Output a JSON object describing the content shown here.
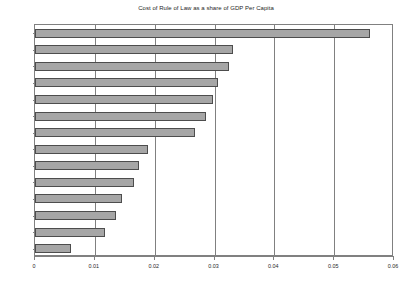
{
  "chart_data": {
    "type": "bar",
    "orientation": "horizontal",
    "title": "Cost of Rule of Law as a share of GDP Per Capita",
    "xlabel": "",
    "ylabel": "",
    "categories": [
      "JAM",
      "BOL",
      "NIC",
      "TTO",
      "VEN",
      "PAN",
      "SLV",
      "ARG",
      "CRI",
      "DOM",
      "URY",
      "CHL",
      "BRA",
      "MEX"
    ],
    "values": [
      0.056,
      0.0331,
      0.0324,
      0.0306,
      0.0298,
      0.0286,
      0.0267,
      0.0189,
      0.0174,
      0.0166,
      0.0146,
      0.0135,
      0.0117,
      0.006
    ],
    "xlim": [
      0,
      0.06
    ],
    "xticks": [
      0,
      0.01,
      0.02,
      0.03,
      0.04,
      0.05,
      0.06
    ],
    "xtick_labels": [
      "0",
      "0.01",
      "0.02",
      "0.03",
      "0.04",
      "0.05",
      "0.06"
    ],
    "grid": "vertical",
    "legend": null,
    "bar_fill_color": "#a6a6a6",
    "bar_border_color": "#4d4d4d",
    "axis_color": "#808080",
    "text_color": "#262626",
    "background_color": "#ffffff"
  }
}
